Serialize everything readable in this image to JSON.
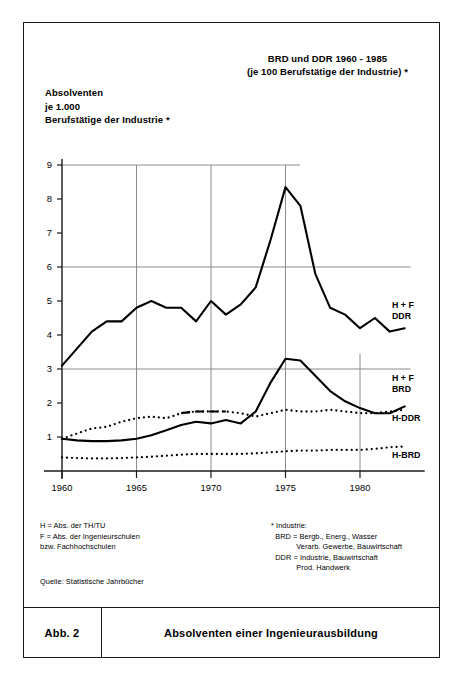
{
  "figure": {
    "caption_number": "Abb. 2",
    "caption_text": "Absolventen einer Ingenieurausbildung"
  },
  "notes": {
    "legend_key": "H = Abs. der TH/TU\nF = Abs. der Ingenieurschulen\nbzw. Fachhochschulen",
    "source": "Quelle: Statistische Jahrbücher",
    "industry_definition": "* Industrie:\n  BRD = Bergb., Energ., Wasser\n            Verarb. Gewerbe, Bauwirtschaft\n  DDR = Industrie, Bauwirtschaft\n            Prod. Handwerk"
  },
  "chart_data": {
    "type": "line",
    "title": "BRD und DDR 1960 - 1985\n(je 100 Berufstätige der Industrie) *",
    "title_line1": "BRD und DDR 1960 - 1985",
    "title_line2": "(je 100 Berufstätige der Industrie) *",
    "ylabel": "Absolventen\nje 1.000\nBerufstätige der Industrie *",
    "ylabel_line1": "Absolventen",
    "ylabel_line2": "je 1.000",
    "ylabel_line3": "Berufstätige der Industrie *",
    "xlabel": "",
    "xlim": [
      1960,
      1983
    ],
    "ylim": [
      0,
      9
    ],
    "yticks": [
      1,
      2,
      3,
      4,
      5,
      6,
      7,
      8,
      9
    ],
    "ytick_labels": [
      "1",
      "2",
      "3",
      "4",
      "5",
      "6",
      "7",
      "8",
      "9"
    ],
    "xticks": [
      1960,
      1965,
      1970,
      1975,
      1980
    ],
    "xtick_labels": [
      "1960",
      "1965",
      "1970",
      "1975",
      "1980"
    ],
    "gridlines_horizontal": [
      3,
      6,
      9
    ],
    "gridlines_vertical": [
      1965,
      1970,
      1975,
      1980
    ],
    "grid": true,
    "legend_position": "right-inline",
    "line_color": "#000000",
    "grid_color": "#808080",
    "axis_color": "#1a1a1a",
    "x": [
      1960,
      1961,
      1962,
      1963,
      1964,
      1965,
      1966,
      1967,
      1968,
      1969,
      1970,
      1971,
      1972,
      1973,
      1974,
      1975,
      1976,
      1977,
      1978,
      1979,
      1980,
      1981,
      1982,
      1983
    ],
    "series": [
      {
        "name": "H + F DDR",
        "label_line1": "H + F",
        "label_line2": "DDR",
        "style": "solid",
        "values": [
          3.1,
          3.6,
          4.1,
          4.4,
          4.4,
          4.8,
          5.0,
          4.8,
          4.8,
          4.4,
          5.0,
          4.6,
          4.9,
          5.4,
          6.8,
          8.35,
          7.8,
          5.8,
          4.8,
          4.6,
          4.2,
          4.5,
          4.1,
          4.2
        ]
      },
      {
        "name": "H + F BRD",
        "label_line1": "H + F",
        "label_line2": "BRD",
        "style": "solid",
        "values": [
          0.95,
          0.9,
          0.88,
          0.88,
          0.9,
          0.95,
          1.05,
          1.2,
          1.35,
          1.45,
          1.4,
          1.5,
          1.4,
          1.75,
          2.6,
          3.3,
          3.25,
          2.8,
          2.35,
          2.05,
          1.85,
          1.7,
          1.7,
          1.9
        ]
      },
      {
        "name": "H-DDR",
        "label_line1": "H-DDR",
        "label_line2": "",
        "style": "dotted",
        "values": [
          0.95,
          1.1,
          1.25,
          1.3,
          1.45,
          1.55,
          1.6,
          1.55,
          1.7,
          1.75,
          1.75,
          1.75,
          1.7,
          1.6,
          1.7,
          1.8,
          1.75,
          1.75,
          1.8,
          1.75,
          1.7,
          1.7,
          1.75,
          1.8
        ]
      },
      {
        "name": "H-BRD",
        "label_line1": "H-BRD",
        "label_line2": "",
        "style": "dotted",
        "values": [
          0.4,
          0.38,
          0.37,
          0.37,
          0.38,
          0.4,
          0.42,
          0.45,
          0.48,
          0.5,
          0.5,
          0.5,
          0.5,
          0.52,
          0.55,
          0.58,
          0.6,
          0.6,
          0.62,
          0.62,
          0.62,
          0.65,
          0.7,
          0.72
        ]
      }
    ]
  }
}
